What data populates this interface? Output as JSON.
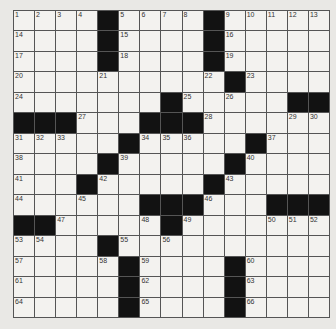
{
  "puzzle": {
    "rows": 15,
    "cols": 15,
    "colors": {
      "block": "#121212",
      "cell": "#f3f2ef",
      "line": "#555555",
      "page": "#e9e8e5"
    },
    "grid": [
      [
        "1",
        "2",
        "3",
        "4",
        "#",
        "5",
        "6",
        "7",
        "8",
        "#",
        "9",
        "10",
        "11",
        "12",
        "13"
      ],
      [
        "14",
        "",
        "",
        "",
        "#",
        "15",
        "",
        "",
        "",
        "#",
        "16",
        "",
        "",
        "",
        ""
      ],
      [
        "17",
        "",
        "",
        "",
        "#",
        "18",
        "",
        "",
        "",
        "#",
        "19",
        "",
        "",
        "",
        ""
      ],
      [
        "20",
        "",
        "",
        "",
        "21",
        "",
        "",
        "",
        "",
        "22",
        "#",
        "23",
        "",
        "",
        ""
      ],
      [
        "24",
        "",
        "",
        "",
        "",
        "",
        "",
        "#",
        "25",
        "",
        "26",
        "",
        "",
        "#",
        "#"
      ],
      [
        "#",
        "#",
        "#",
        "27",
        "",
        "",
        "#",
        "#",
        "#",
        "28",
        "",
        "",
        "",
        "29",
        "30"
      ],
      [
        "31",
        "32",
        "33",
        "",
        "",
        "#",
        "34",
        "35",
        "36",
        "",
        "",
        "#",
        "37",
        "",
        ""
      ],
      [
        "38",
        "",
        "",
        "",
        "#",
        "39",
        "",
        "",
        "",
        "",
        "#",
        "40",
        "",
        "",
        ""
      ],
      [
        "41",
        "",
        "",
        "#",
        "42",
        "",
        "",
        "",
        "",
        "#",
        "43",
        "",
        "",
        "",
        ""
      ],
      [
        "44",
        "",
        "",
        "45",
        "",
        "",
        "#",
        "#",
        "#",
        "46",
        "",
        "",
        "#",
        "#",
        "#"
      ],
      [
        "#",
        "#",
        "47",
        "",
        "",
        "",
        "48",
        "#",
        "49",
        "",
        "",
        "",
        "50",
        "51",
        "52"
      ],
      [
        "53",
        "54",
        "",
        "",
        "#",
        "55",
        "",
        "56",
        "",
        "",
        "",
        "",
        "",
        "",
        ""
      ],
      [
        "57",
        "",
        "",
        "",
        "58",
        "#",
        "59",
        "",
        "",
        "",
        "#",
        "60",
        "",
        "",
        ""
      ],
      [
        "61",
        "",
        "",
        "",
        "",
        "#",
        "62",
        "",
        "",
        "",
        "#",
        "63",
        "",
        "",
        ""
      ],
      [
        "64",
        "",
        "",
        "",
        "",
        "#",
        "65",
        "",
        "",
        "",
        "#",
        "66",
        "",
        "",
        ""
      ]
    ]
  }
}
